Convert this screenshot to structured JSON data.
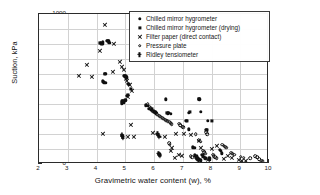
{
  "chart_data": {
    "type": "scatter",
    "title": "",
    "xlabel": "Gravimetric water content (w), %",
    "ylabel": "Suction, kPa",
    "xlim": [
      2,
      10
    ],
    "ylim": [
      0,
      1000
    ],
    "xticks": [
      2,
      3,
      4,
      5,
      6,
      7,
      8,
      9,
      10
    ],
    "yticks": [
      0,
      100,
      200,
      300,
      400,
      500,
      600,
      700,
      800,
      900,
      1000
    ],
    "grid": true,
    "legend_position": "upper right",
    "series": [
      {
        "name": "Chilled mirror hygrometer",
        "marker": "filled-circle",
        "color": "#101010",
        "points": [
          [
            4.15,
            805
          ],
          [
            4.2,
            800
          ],
          [
            4.22,
            812
          ],
          [
            4.38,
            820
          ],
          [
            4.42,
            818
          ],
          [
            4.45,
            808
          ],
          [
            4.3,
            600
          ],
          [
            4.22,
            552
          ],
          [
            4.26,
            545
          ],
          [
            4.3,
            540
          ],
          [
            4.95,
            590
          ],
          [
            5.0,
            585
          ],
          [
            5.05,
            578
          ],
          [
            5.1,
            535
          ],
          [
            5.12,
            530
          ],
          [
            4.9,
            418
          ],
          [
            4.95,
            412
          ],
          [
            4.88,
            405
          ],
          [
            5.0,
            425
          ],
          [
            5.05,
            455
          ],
          [
            4.88,
            196
          ],
          [
            4.9,
            188
          ],
          [
            4.92,
            178
          ],
          [
            5.72,
            392
          ],
          [
            5.78,
            388
          ],
          [
            5.82,
            370
          ],
          [
            5.88,
            362
          ],
          [
            6.0,
            352
          ],
          [
            6.05,
            345
          ],
          [
            6.48,
            338
          ],
          [
            6.52,
            342
          ],
          [
            6.58,
            335
          ],
          [
            6.4,
            432
          ],
          [
            7.58,
            432
          ],
          [
            7.22,
            342
          ],
          [
            7.62,
            348
          ],
          [
            7.12,
            288
          ],
          [
            7.88,
            288
          ],
          [
            7.2,
            232
          ],
          [
            7.82,
            228
          ],
          [
            6.18,
            70
          ],
          [
            6.2,
            62
          ],
          [
            7.35,
            112
          ],
          [
            7.4,
            108
          ],
          [
            7.42,
            58
          ],
          [
            7.48,
            52
          ],
          [
            7.5,
            42
          ],
          [
            7.55,
            36
          ],
          [
            7.58,
            30
          ],
          [
            7.62,
            25
          ],
          [
            7.68,
            62
          ],
          [
            7.72,
            48
          ],
          [
            7.78,
            38
          ],
          [
            8.28,
            96
          ],
          [
            8.32,
            88
          ],
          [
            8.35,
            72
          ],
          [
            7.92,
            38
          ],
          [
            7.95,
            30
          ]
        ]
      },
      {
        "name": "Chilled mirror hygrometer (drying)",
        "marker": "filled-square",
        "color": "#101010",
        "points": [
          [
            4.12,
            808
          ],
          [
            4.18,
            798
          ],
          [
            4.4,
            822
          ],
          [
            4.28,
            598
          ],
          [
            4.98,
            588
          ],
          [
            5.02,
            582
          ],
          [
            4.92,
            420
          ],
          [
            5.08,
            462
          ],
          [
            5.2,
            498
          ],
          [
            5.92,
            365
          ],
          [
            6.45,
            340
          ],
          [
            7.25,
            345
          ],
          [
            7.15,
            290
          ],
          [
            7.55,
            435
          ],
          [
            8.02,
            290
          ],
          [
            7.85,
            230
          ]
        ]
      },
      {
        "name": "Filter paper (direct contact)",
        "marker": "cross",
        "color": "#101010",
        "points": [
          [
            4.28,
            928
          ],
          [
            4.12,
            752
          ],
          [
            4.6,
            800
          ],
          [
            3.65,
            658
          ],
          [
            3.4,
            585
          ],
          [
            4.8,
            678
          ],
          [
            4.88,
            648
          ],
          [
            4.95,
            625
          ],
          [
            5.02,
            570
          ],
          [
            5.05,
            552
          ],
          [
            5.15,
            530
          ],
          [
            3.85,
            578
          ],
          [
            4.55,
            612
          ],
          [
            5.22,
            490
          ],
          [
            5.1,
            448
          ],
          [
            5.18,
            262
          ],
          [
            4.22,
            202
          ],
          [
            5.08,
            178
          ],
          [
            5.3,
            180
          ],
          [
            5.95,
            208
          ],
          [
            6.38,
            182
          ],
          [
            6.75,
            198
          ],
          [
            7.02,
            198
          ],
          [
            7.28,
            192
          ],
          [
            6.62,
            108
          ],
          [
            6.58,
            90
          ],
          [
            6.72,
            44
          ],
          [
            6.98,
            52
          ],
          [
            7.55,
            155
          ],
          [
            7.62,
            108
          ],
          [
            8.02,
            98
          ],
          [
            8.18,
            118
          ],
          [
            8.55,
            52
          ],
          [
            8.72,
            38
          ],
          [
            9.05,
            22
          ],
          [
            9.18,
            20
          ],
          [
            8.95,
            28
          ],
          [
            7.88,
            30
          ],
          [
            8.42,
            36
          ],
          [
            6.88,
            62
          ]
        ]
      },
      {
        "name": "Pressure plate",
        "marker": "open-circle",
        "color": "#101010",
        "points": [
          [
            5.78,
            398
          ],
          [
            5.85,
            382
          ],
          [
            5.88,
            372
          ],
          [
            5.92,
            358
          ],
          [
            5.98,
            350
          ],
          [
            6.02,
            345
          ],
          [
            6.08,
            338
          ],
          [
            6.12,
            330
          ],
          [
            6.18,
            322
          ],
          [
            6.22,
            316
          ],
          [
            6.28,
            310
          ],
          [
            6.32,
            302
          ],
          [
            6.38,
            296
          ],
          [
            6.42,
            290
          ],
          [
            6.48,
            285
          ],
          [
            6.55,
            280
          ],
          [
            6.58,
            272
          ],
          [
            6.62,
            265
          ],
          [
            6.88,
            268
          ],
          [
            6.92,
            258
          ],
          [
            6.98,
            250
          ],
          [
            7.02,
            244
          ],
          [
            7.45,
            198
          ],
          [
            7.55,
            158
          ],
          [
            7.62,
            150
          ],
          [
            7.82,
            212
          ],
          [
            7.85,
            198
          ],
          [
            8.38,
            128
          ],
          [
            8.42,
            122
          ],
          [
            8.48,
            115
          ],
          [
            8.52,
            108
          ],
          [
            8.68,
            75
          ],
          [
            8.72,
            68
          ],
          [
            8.78,
            62
          ],
          [
            9.02,
            48
          ],
          [
            9.12,
            42
          ],
          [
            9.35,
            38
          ],
          [
            9.52,
            52
          ],
          [
            9.58,
            45
          ],
          [
            9.65,
            32
          ],
          [
            9.72,
            22
          ],
          [
            9.78,
            18
          ],
          [
            7.72,
            88
          ],
          [
            7.75,
            78
          ],
          [
            7.78,
            68
          ],
          [
            8.05,
            62
          ],
          [
            8.08,
            52
          ],
          [
            8.12,
            45
          ],
          [
            8.18,
            38
          ],
          [
            7.28,
            52
          ],
          [
            7.32,
            44
          ],
          [
            6.52,
            140
          ],
          [
            6.55,
            128
          ]
        ]
      },
      {
        "name": "Ridley tensiometer",
        "marker": "tensiometer",
        "color": "#101010",
        "points": [
          [
            4.88,
            196
          ],
          [
            4.9,
            185
          ],
          [
            4.92,
            172
          ],
          [
            6.12,
            202
          ],
          [
            6.15,
            192
          ],
          [
            6.18,
            182
          ],
          [
            6.16,
            72
          ],
          [
            6.18,
            62
          ],
          [
            6.2,
            55
          ],
          [
            7.48,
            42
          ],
          [
            7.52,
            32
          ],
          [
            7.55,
            25
          ]
        ]
      }
    ]
  },
  "legend": {
    "items": [
      {
        "label": "Chilled mirror hygrometer",
        "marker": "filled-circle"
      },
      {
        "label": "Chilled mirror hygrometer (drying)",
        "marker": "filled-square"
      },
      {
        "label": "Filter paper (direct contact)",
        "marker": "cross"
      },
      {
        "label": "Pressure plate",
        "marker": "open-circle"
      },
      {
        "label": "Ridley tensiometer",
        "marker": "tensiometer"
      }
    ]
  }
}
